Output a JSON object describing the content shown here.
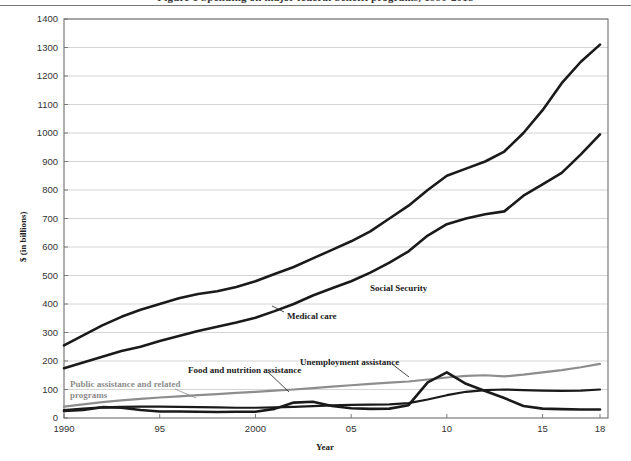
{
  "page": {
    "clipped_headline": "Figure 1  Spending on major federal benefit programs, 1990-2018"
  },
  "chart_data": {
    "type": "line",
    "title": "",
    "xlabel": "Year",
    "ylabel": "$ (in billions)",
    "xlim": [
      1990,
      2018
    ],
    "ylim": [
      0,
      1400
    ],
    "ytick_step": 100,
    "grid": true,
    "legend_position": "inline-annotations",
    "xticks": [
      {
        "value": 1990,
        "label": "1990"
      },
      {
        "value": 1995,
        "label": "95"
      },
      {
        "value": 2000,
        "label": "2000"
      },
      {
        "value": 2005,
        "label": "05"
      },
      {
        "value": 2010,
        "label": "10"
      },
      {
        "value": 2015,
        "label": "15"
      },
      {
        "value": 2018,
        "label": "18"
      }
    ],
    "yticks": [
      {
        "value": 0,
        "label": "0"
      },
      {
        "value": 100,
        "label": "100"
      },
      {
        "value": 200,
        "label": "200"
      },
      {
        "value": 300,
        "label": "300"
      },
      {
        "value": 400,
        "label": "400"
      },
      {
        "value": 500,
        "label": "500"
      },
      {
        "value": 600,
        "label": "600"
      },
      {
        "value": 700,
        "label": "700"
      },
      {
        "value": 800,
        "label": "800"
      },
      {
        "value": 900,
        "label": "900"
      },
      {
        "value": 1000,
        "label": "1000"
      },
      {
        "value": 1100,
        "label": "1100"
      },
      {
        "value": 1200,
        "label": "1200"
      },
      {
        "value": 1300,
        "label": "1300"
      },
      {
        "value": 1400,
        "label": "1400"
      }
    ],
    "x": [
      1990,
      1991,
      1992,
      1993,
      1994,
      1995,
      1996,
      1997,
      1998,
      1999,
      2000,
      2001,
      2002,
      2003,
      2004,
      2005,
      2006,
      2007,
      2008,
      2009,
      2010,
      2011,
      2012,
      2013,
      2014,
      2015,
      2016,
      2017,
      2018
    ],
    "series": [
      {
        "name": "Medical care",
        "color": "#1a1a1a",
        "width": 2.6,
        "label": "Medical care",
        "values": [
          255,
          290,
          325,
          355,
          380,
          400,
          420,
          435,
          445,
          460,
          480,
          505,
          530,
          560,
          590,
          620,
          655,
          700,
          745,
          800,
          850,
          875,
          900,
          935,
          1000,
          1080,
          1175,
          1250,
          1310
        ]
      },
      {
        "name": "Social Security",
        "color": "#1a1a1a",
        "width": 2.6,
        "label": "Social Security",
        "values": [
          175,
          195,
          215,
          235,
          250,
          270,
          288,
          305,
          320,
          335,
          352,
          375,
          400,
          430,
          455,
          480,
          510,
          545,
          585,
          640,
          680,
          700,
          715,
          725,
          780,
          820,
          860,
          925,
          995
        ]
      },
      {
        "name": "Public assistance and related programs",
        "color": "#8d8d8d",
        "width": 2.2,
        "label": "Public assistance and related programs",
        "values": [
          40,
          48,
          56,
          62,
          67,
          72,
          76,
          80,
          84,
          88,
          92,
          96,
          100,
          105,
          110,
          115,
          120,
          124,
          128,
          135,
          142,
          148,
          150,
          146,
          152,
          160,
          168,
          178,
          190
        ]
      },
      {
        "name": "Food and nutrition assistance",
        "color": "#1a1a1a",
        "width": 2.2,
        "label": "Food and nutrition assistance",
        "values": [
          28,
          33,
          37,
          39,
          40,
          40,
          39,
          38,
          37,
          36,
          36,
          37,
          39,
          42,
          44,
          46,
          47,
          48,
          52,
          65,
          80,
          92,
          98,
          100,
          98,
          96,
          95,
          96,
          100
        ]
      },
      {
        "name": "Unemployment assistance",
        "color": "#1a1a1a",
        "width": 2.6,
        "label": "Unemployment assistance",
        "values": [
          25,
          28,
          38,
          36,
          28,
          23,
          23,
          22,
          21,
          22,
          22,
          32,
          54,
          57,
          42,
          34,
          32,
          33,
          45,
          125,
          160,
          120,
          95,
          70,
          42,
          33,
          31,
          30,
          30
        ]
      }
    ],
    "annotations": [
      {
        "text": "Social Security",
        "x_px": 370,
        "y_px": 283,
        "color": "#1a1a1a",
        "leader": false
      },
      {
        "text": "Medical care",
        "x_px": 287,
        "y_px": 311,
        "color": "#1a1a1a",
        "leader": true
      },
      {
        "text": "Unemployment assistance",
        "x_px": 300,
        "y_px": 357,
        "color": "#1a1a1a",
        "leader": true
      },
      {
        "text": "Food and nutrition assistance",
        "x_px": 188,
        "y_px": 365,
        "color": "#1a1a1a",
        "leader": true
      },
      {
        "text": "Public assistance and related programs",
        "x_px": 70,
        "y_px": 379,
        "color": "#8d8d8d",
        "leader": true
      }
    ],
    "colors": {
      "grid": "#c9c9c9",
      "axis": "#6e6e6e",
      "primary": "#1a1a1a",
      "secondary": "#8d8d8d",
      "background": "#ffffff"
    }
  }
}
